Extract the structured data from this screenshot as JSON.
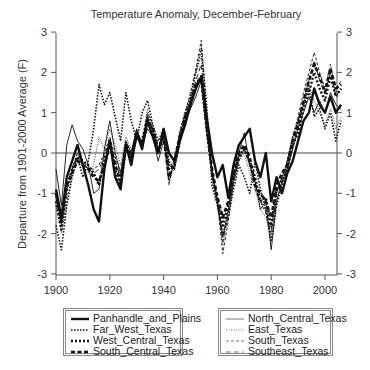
{
  "chart_data": {
    "type": "line",
    "title": "Temperature Anomaly, December-February",
    "xlabel": "",
    "ylabel": "Departure from 1901-2000 Average (F)",
    "xlim": [
      1900,
      2006
    ],
    "ylim": [
      -3,
      3
    ],
    "xticks": [
      1900,
      1920,
      1940,
      1960,
      1980,
      2000
    ],
    "yticks": [
      3,
      2,
      1,
      0,
      -1,
      -2,
      -3
    ],
    "grid": false,
    "zero_line": true,
    "legend_position": "below",
    "x": [
      1900,
      1902,
      1904,
      1906,
      1908,
      1910,
      1912,
      1914,
      1916,
      1918,
      1920,
      1922,
      1924,
      1926,
      1928,
      1930,
      1932,
      1934,
      1936,
      1938,
      1940,
      1942,
      1944,
      1946,
      1948,
      1950,
      1952,
      1954,
      1956,
      1958,
      1960,
      1962,
      1964,
      1966,
      1968,
      1970,
      1972,
      1974,
      1976,
      1978,
      1980,
      1982,
      1984,
      1986,
      1988,
      1990,
      1992,
      1994,
      1996,
      1998,
      2000,
      2002,
      2004,
      2006
    ],
    "series": [
      {
        "name": "Panhandle_and_Plains",
        "style": "thick-solid",
        "values": [
          -0.9,
          -1.6,
          -0.6,
          -0.2,
          0.2,
          -0.3,
          -0.8,
          -1.4,
          -1.7,
          -0.4,
          0.3,
          -0.6,
          -0.9,
          0.2,
          -0.3,
          0.5,
          0.1,
          0.8,
          0.4,
          0.0,
          0.6,
          0.0,
          -0.2,
          0.3,
          0.7,
          1.2,
          1.6,
          1.9,
          0.9,
          0.0,
          -0.6,
          -0.3,
          -1.1,
          -0.3,
          0.2,
          0.4,
          0.6,
          -0.2,
          -0.6,
          0.0,
          -1.2,
          -0.6,
          -1.0,
          -0.5,
          -0.2,
          0.3,
          0.8,
          1.0,
          1.6,
          1.2,
          1.0,
          1.4,
          1.0,
          1.2
        ]
      },
      {
        "name": "Far_West_Texas",
        "style": "dotted",
        "values": [
          -1.8,
          -2.4,
          -1.3,
          -0.6,
          -0.1,
          -0.6,
          -0.2,
          0.6,
          1.7,
          1.2,
          1.5,
          0.9,
          0.3,
          1.5,
          0.8,
          0.3,
          1.0,
          1.3,
          0.7,
          0.3,
          0.6,
          -0.2,
          -0.4,
          0.5,
          1.0,
          1.4,
          2.0,
          2.6,
          1.2,
          -0.8,
          -1.3,
          -2.0,
          -1.6,
          -0.9,
          -0.3,
          -0.6,
          -1.0,
          -0.2,
          -0.9,
          -1.4,
          -2.2,
          -1.3,
          -0.8,
          -0.2,
          0.4,
          0.8,
          1.2,
          1.6,
          0.9,
          1.1,
          0.6,
          1.0,
          0.3,
          0.8
        ]
      },
      {
        "name": "West_Central_Texas",
        "style": "dotted-bold",
        "values": [
          -1.2,
          -1.9,
          -0.9,
          -0.4,
          -0.1,
          -0.2,
          -0.3,
          -0.5,
          -0.8,
          -0.2,
          0.3,
          -0.4,
          -0.8,
          0.1,
          -0.1,
          0.4,
          0.3,
          0.9,
          0.5,
          0.0,
          0.5,
          -0.4,
          -0.3,
          0.3,
          0.9,
          1.3,
          1.7,
          1.8,
          0.6,
          -0.5,
          -1.2,
          -1.8,
          -1.3,
          -0.6,
          -0.1,
          0.1,
          -0.2,
          -0.6,
          -1.2,
          -1.1,
          -1.8,
          -0.9,
          -0.7,
          -0.4,
          0.2,
          0.5,
          1.1,
          1.5,
          2.0,
          1.6,
          1.3,
          1.9,
          1.4,
          1.6
        ]
      },
      {
        "name": "South_Central_Texas",
        "style": "dashed-bold",
        "values": [
          -1.0,
          -1.7,
          -0.8,
          -0.5,
          -0.2,
          -0.3,
          -0.4,
          -0.6,
          -0.7,
          -0.3,
          0.2,
          -0.3,
          -0.7,
          0.2,
          -0.1,
          0.5,
          0.2,
          0.8,
          0.6,
          0.1,
          0.4,
          -0.6,
          -0.2,
          0.4,
          0.8,
          1.2,
          1.7,
          1.9,
          0.7,
          -0.4,
          -1.1,
          -1.6,
          -1.2,
          -0.5,
          0.0,
          0.2,
          -0.1,
          -0.8,
          -1.0,
          -1.2,
          -1.6,
          -0.8,
          -0.5,
          -0.3,
          0.3,
          0.7,
          1.3,
          1.8,
          2.2,
          1.9,
          1.5,
          2.1,
          1.6,
          1.7
        ]
      },
      {
        "name": "North_Central_Texas",
        "style": "thin-solid",
        "values": [
          -0.4,
          -1.3,
          0.2,
          0.7,
          0.3,
          0.1,
          -0.3,
          -1.0,
          -0.9,
          0.1,
          0.8,
          0.0,
          -0.5,
          0.3,
          0.0,
          0.6,
          0.2,
          0.6,
          0.4,
          -0.2,
          0.3,
          -0.3,
          -0.4,
          0.2,
          0.8,
          1.1,
          1.4,
          1.8,
          0.5,
          -0.4,
          -1.2,
          -2.1,
          -1.4,
          -0.6,
          0.0,
          0.5,
          -0.3,
          -0.7,
          -1.4,
          -1.2,
          -2.4,
          -1.2,
          -0.7,
          -0.4,
          0.1,
          0.6,
          1.0,
          1.4,
          1.0,
          1.3,
          1.0,
          1.5,
          1.2,
          1.1
        ]
      },
      {
        "name": "East_Texas",
        "style": "thin-dotted",
        "values": [
          -1.3,
          -2.0,
          -1.2,
          -0.5,
          0.0,
          -0.4,
          -0.5,
          -0.3,
          0.4,
          0.1,
          0.6,
          0.2,
          -0.3,
          0.4,
          0.1,
          0.5,
          0.3,
          1.1,
          0.6,
          0.0,
          0.4,
          -0.7,
          -0.4,
          0.4,
          0.9,
          1.3,
          2.0,
          2.4,
          0.8,
          -0.6,
          -1.3,
          -2.3,
          -1.6,
          -0.8,
          -0.2,
          0.0,
          -0.5,
          -0.9,
          -1.4,
          -1.6,
          -2.1,
          -1.1,
          -0.8,
          -0.3,
          0.2,
          0.7,
          1.2,
          1.7,
          1.3,
          1.0,
          0.7,
          1.1,
          0.6,
          0.9
        ]
      },
      {
        "name": "South_Texas",
        "style": "thin-dashed",
        "values": [
          -1.1,
          -1.8,
          -0.9,
          -0.4,
          0.0,
          -0.2,
          -0.4,
          -0.4,
          -0.3,
          0.0,
          0.4,
          -0.1,
          -0.5,
          0.3,
          0.0,
          0.6,
          0.2,
          1.0,
          0.7,
          0.1,
          0.4,
          -0.8,
          -0.1,
          0.5,
          1.0,
          1.5,
          2.1,
          2.8,
          1.0,
          -0.5,
          -1.2,
          -2.5,
          -1.7,
          -0.7,
          -0.2,
          0.1,
          -0.3,
          -0.9,
          -1.2,
          -1.5,
          -2.0,
          -1.0,
          -0.6,
          -0.2,
          0.4,
          0.9,
          1.5,
          2.0,
          2.5,
          2.0,
          1.6,
          2.2,
          1.5,
          1.8
        ]
      },
      {
        "name": "Southeast_Texas",
        "style": "thin-longdash",
        "values": [
          -1.0,
          -1.7,
          -0.8,
          -0.4,
          -0.1,
          -0.3,
          -0.4,
          -0.5,
          -0.4,
          -0.1,
          0.3,
          -0.2,
          -0.6,
          0.2,
          -0.1,
          0.5,
          0.2,
          0.9,
          0.6,
          0.0,
          0.4,
          -0.7,
          -0.2,
          0.4,
          0.9,
          1.3,
          1.8,
          2.2,
          0.8,
          -0.5,
          -1.2,
          -2.2,
          -1.5,
          -0.7,
          -0.1,
          0.1,
          -0.3,
          -0.8,
          -1.2,
          -1.4,
          -1.9,
          -1.0,
          -0.6,
          -0.2,
          0.3,
          0.8,
          1.3,
          1.8,
          2.3,
          1.8,
          1.5,
          2.0,
          1.4,
          1.6
        ]
      }
    ]
  },
  "legend": {
    "left": [
      "Panhandle_and_Plains",
      "Far_West_Texas",
      "West_Central_Texas",
      "South_Central_Texas"
    ],
    "right": [
      "North_Central_Texas",
      "East_Texas",
      "South_Texas",
      "Southeast_Texas"
    ]
  },
  "colors": {
    "axis": "#555555",
    "line": "#111111",
    "legend_border": "#888888"
  }
}
